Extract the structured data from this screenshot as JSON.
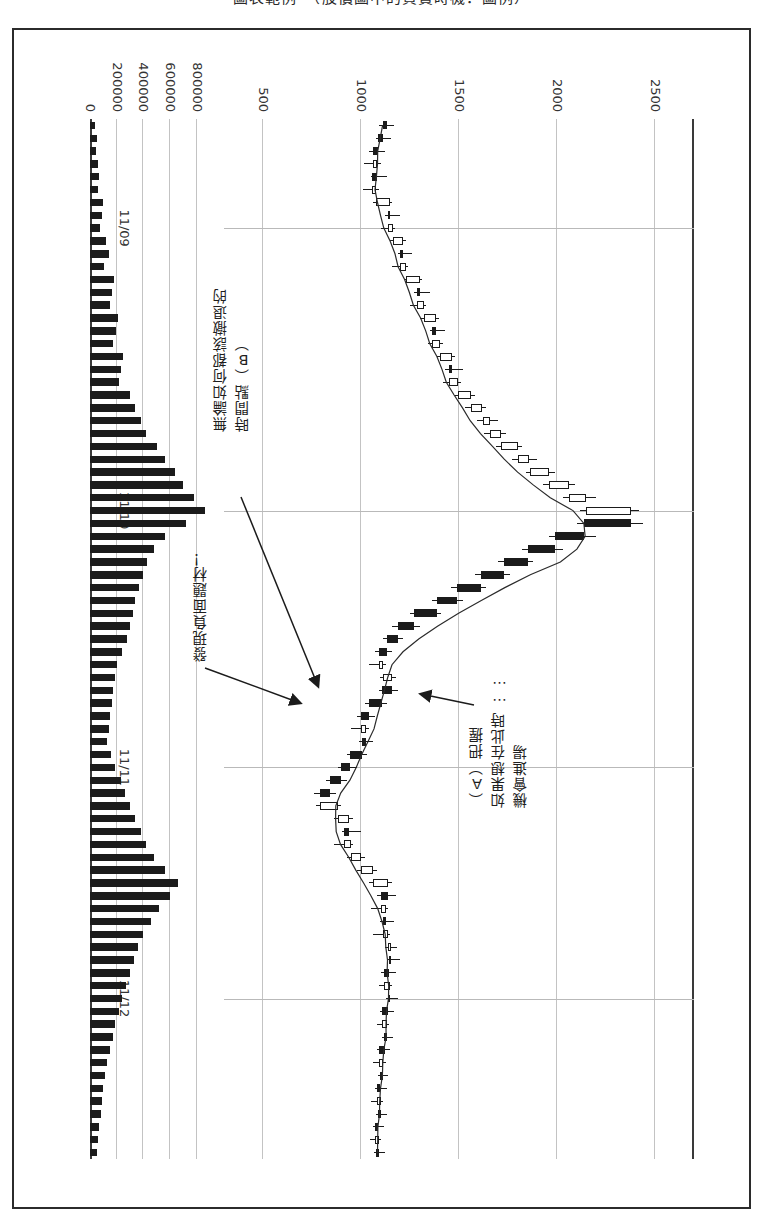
{
  "page": {
    "title": "圖表範例　（股價圖中的買賣時機．圖例）"
  },
  "chart_data": {
    "type": "candlestick",
    "orientation": "rotated-90",
    "xlabel": "",
    "ylabel": "股價",
    "price_axis": {
      "ticks": [
        2500,
        2000,
        1500,
        1000,
        500
      ],
      "ylim": [
        300,
        2700
      ],
      "grid": true
    },
    "volume_axis": {
      "label": "成交量",
      "ticks": [
        800000,
        600000,
        400000,
        200000,
        0
      ],
      "ylim": [
        0,
        900000
      ],
      "grid": true
    },
    "date_ticks": [
      "11/09",
      "11/10",
      "11/11",
      "11/12"
    ],
    "legend": [],
    "series": [
      {
        "name": "移動平均線",
        "type": "line"
      },
      {
        "name": "K線（陰陽燭）",
        "type": "candlestick"
      },
      {
        "name": "成交量",
        "type": "bar"
      }
    ],
    "candles": [
      {
        "o": 1130,
        "h": 1170,
        "l": 1090,
        "c": 1110,
        "v": 40000
      },
      {
        "o": 1110,
        "h": 1155,
        "l": 1075,
        "c": 1085,
        "v": 55000
      },
      {
        "o": 1085,
        "h": 1120,
        "l": 1040,
        "c": 1060,
        "v": 48000
      },
      {
        "o": 1060,
        "h": 1100,
        "l": 1015,
        "c": 1080,
        "v": 62000
      },
      {
        "o": 1080,
        "h": 1130,
        "l": 1050,
        "c": 1055,
        "v": 70000
      },
      {
        "o": 1055,
        "h": 1090,
        "l": 1010,
        "c": 1075,
        "v": 58000
      },
      {
        "o": 1075,
        "h": 1160,
        "l": 1060,
        "c": 1150,
        "v": 95000
      },
      {
        "o": 1150,
        "h": 1200,
        "l": 1120,
        "c": 1135,
        "v": 88000
      },
      {
        "o": 1135,
        "h": 1175,
        "l": 1100,
        "c": 1165,
        "v": 76000
      },
      {
        "o": 1165,
        "h": 1230,
        "l": 1150,
        "c": 1215,
        "v": 120000
      },
      {
        "o": 1215,
        "h": 1260,
        "l": 1190,
        "c": 1200,
        "v": 140000
      },
      {
        "o": 1200,
        "h": 1240,
        "l": 1160,
        "c": 1230,
        "v": 105000
      },
      {
        "o": 1230,
        "h": 1310,
        "l": 1220,
        "c": 1300,
        "v": 180000
      },
      {
        "o": 1300,
        "h": 1350,
        "l": 1270,
        "c": 1285,
        "v": 165000
      },
      {
        "o": 1285,
        "h": 1330,
        "l": 1250,
        "c": 1320,
        "v": 150000
      },
      {
        "o": 1320,
        "h": 1400,
        "l": 1300,
        "c": 1385,
        "v": 210000
      },
      {
        "o": 1385,
        "h": 1430,
        "l": 1350,
        "c": 1360,
        "v": 195000
      },
      {
        "o": 1360,
        "h": 1420,
        "l": 1340,
        "c": 1405,
        "v": 175000
      },
      {
        "o": 1405,
        "h": 1480,
        "l": 1390,
        "c": 1465,
        "v": 250000
      },
      {
        "o": 1465,
        "h": 1520,
        "l": 1430,
        "c": 1450,
        "v": 230000
      },
      {
        "o": 1450,
        "h": 1510,
        "l": 1420,
        "c": 1495,
        "v": 215000
      },
      {
        "o": 1495,
        "h": 1580,
        "l": 1480,
        "c": 1560,
        "v": 300000
      },
      {
        "o": 1560,
        "h": 1640,
        "l": 1530,
        "c": 1620,
        "v": 340000
      },
      {
        "o": 1620,
        "h": 1700,
        "l": 1590,
        "c": 1660,
        "v": 380000
      },
      {
        "o": 1660,
        "h": 1740,
        "l": 1630,
        "c": 1715,
        "v": 420000
      },
      {
        "o": 1715,
        "h": 1820,
        "l": 1690,
        "c": 1800,
        "v": 500000
      },
      {
        "o": 1800,
        "h": 1900,
        "l": 1770,
        "c": 1860,
        "v": 560000
      },
      {
        "o": 1860,
        "h": 1990,
        "l": 1840,
        "c": 1960,
        "v": 640000
      },
      {
        "o": 1960,
        "h": 2090,
        "l": 1930,
        "c": 2060,
        "v": 700000
      },
      {
        "o": 2060,
        "h": 2200,
        "l": 2030,
        "c": 2150,
        "v": 780000
      },
      {
        "o": 2150,
        "h": 2420,
        "l": 2120,
        "c": 2380,
        "v": 860000
      },
      {
        "o": 2380,
        "h": 2440,
        "l": 2100,
        "c": 2140,
        "v": 720000
      },
      {
        "o": 2140,
        "h": 2200,
        "l": 1960,
        "c": 1990,
        "v": 560000
      },
      {
        "o": 1990,
        "h": 2030,
        "l": 1820,
        "c": 1850,
        "v": 480000
      },
      {
        "o": 1850,
        "h": 1880,
        "l": 1700,
        "c": 1730,
        "v": 430000
      },
      {
        "o": 1730,
        "h": 1760,
        "l": 1580,
        "c": 1610,
        "v": 400000
      },
      {
        "o": 1610,
        "h": 1640,
        "l": 1460,
        "c": 1490,
        "v": 370000
      },
      {
        "o": 1490,
        "h": 1520,
        "l": 1360,
        "c": 1390,
        "v": 340000
      },
      {
        "o": 1390,
        "h": 1410,
        "l": 1250,
        "c": 1270,
        "v": 320000
      },
      {
        "o": 1270,
        "h": 1300,
        "l": 1160,
        "c": 1190,
        "v": 300000
      },
      {
        "o": 1190,
        "h": 1215,
        "l": 1110,
        "c": 1130,
        "v": 280000
      },
      {
        "o": 1130,
        "h": 1160,
        "l": 1070,
        "c": 1090,
        "v": 240000
      },
      {
        "o": 1090,
        "h": 1125,
        "l": 1040,
        "c": 1110,
        "v": 200000
      },
      {
        "o": 1110,
        "h": 1180,
        "l": 1095,
        "c": 1160,
        "v": 185000
      },
      {
        "o": 1160,
        "h": 1190,
        "l": 1090,
        "c": 1105,
        "v": 175000
      },
      {
        "o": 1105,
        "h": 1130,
        "l": 1020,
        "c": 1040,
        "v": 165000
      },
      {
        "o": 1040,
        "h": 1070,
        "l": 980,
        "c": 1000,
        "v": 150000
      },
      {
        "o": 1000,
        "h": 1040,
        "l": 950,
        "c": 1025,
        "v": 140000
      },
      {
        "o": 1025,
        "h": 1060,
        "l": 990,
        "c": 1005,
        "v": 130000
      },
      {
        "o": 1005,
        "h": 1030,
        "l": 930,
        "c": 945,
        "v": 155000
      },
      {
        "o": 945,
        "h": 980,
        "l": 880,
        "c": 900,
        "v": 190000
      },
      {
        "o": 900,
        "h": 930,
        "l": 820,
        "c": 840,
        "v": 230000
      },
      {
        "o": 840,
        "h": 870,
        "l": 760,
        "c": 790,
        "v": 260000
      },
      {
        "o": 790,
        "h": 900,
        "l": 770,
        "c": 880,
        "v": 300000
      },
      {
        "o": 880,
        "h": 960,
        "l": 860,
        "c": 940,
        "v": 340000
      },
      {
        "o": 940,
        "h": 1000,
        "l": 900,
        "c": 915,
        "v": 380000
      },
      {
        "o": 915,
        "h": 960,
        "l": 860,
        "c": 950,
        "v": 420000
      },
      {
        "o": 950,
        "h": 1020,
        "l": 930,
        "c": 1000,
        "v": 480000
      },
      {
        "o": 1000,
        "h": 1080,
        "l": 980,
        "c": 1060,
        "v": 560000
      },
      {
        "o": 1060,
        "h": 1160,
        "l": 1040,
        "c": 1140,
        "v": 660000
      },
      {
        "o": 1140,
        "h": 1180,
        "l": 1080,
        "c": 1100,
        "v": 600000
      },
      {
        "o": 1100,
        "h": 1140,
        "l": 1050,
        "c": 1125,
        "v": 520000
      },
      {
        "o": 1125,
        "h": 1170,
        "l": 1095,
        "c": 1110,
        "v": 460000
      },
      {
        "o": 1110,
        "h": 1150,
        "l": 1060,
        "c": 1140,
        "v": 400000
      },
      {
        "o": 1140,
        "h": 1185,
        "l": 1120,
        "c": 1155,
        "v": 360000
      },
      {
        "o": 1155,
        "h": 1200,
        "l": 1130,
        "c": 1145,
        "v": 330000
      },
      {
        "o": 1145,
        "h": 1180,
        "l": 1100,
        "c": 1115,
        "v": 300000
      },
      {
        "o": 1115,
        "h": 1160,
        "l": 1090,
        "c": 1150,
        "v": 270000
      },
      {
        "o": 1150,
        "h": 1190,
        "l": 1125,
        "c": 1135,
        "v": 240000
      },
      {
        "o": 1135,
        "h": 1170,
        "l": 1095,
        "c": 1105,
        "v": 215000
      },
      {
        "o": 1105,
        "h": 1145,
        "l": 1080,
        "c": 1130,
        "v": 190000
      },
      {
        "o": 1130,
        "h": 1165,
        "l": 1105,
        "c": 1120,
        "v": 170000
      },
      {
        "o": 1120,
        "h": 1150,
        "l": 1080,
        "c": 1090,
        "v": 150000
      },
      {
        "o": 1090,
        "h": 1125,
        "l": 1060,
        "c": 1110,
        "v": 130000
      },
      {
        "o": 1110,
        "h": 1140,
        "l": 1085,
        "c": 1095,
        "v": 115000
      },
      {
        "o": 1095,
        "h": 1130,
        "l": 1070,
        "c": 1080,
        "v": 100000
      },
      {
        "o": 1080,
        "h": 1110,
        "l": 1050,
        "c": 1100,
        "v": 90000
      },
      {
        "o": 1100,
        "h": 1130,
        "l": 1075,
        "c": 1085,
        "v": 80000
      },
      {
        "o": 1085,
        "h": 1115,
        "l": 1060,
        "c": 1070,
        "v": 70000
      },
      {
        "o": 1070,
        "h": 1100,
        "l": 1045,
        "c": 1090,
        "v": 60000
      },
      {
        "o": 1090,
        "h": 1120,
        "l": 1065,
        "c": 1075,
        "v": 50000
      }
    ]
  },
  "annotations": {
    "b": "無論如何都該撤退的\n時間點（B）",
    "negative": "發現負面題材！",
    "a": "（A）把握\n如果想在此時……\n機會進場"
  }
}
